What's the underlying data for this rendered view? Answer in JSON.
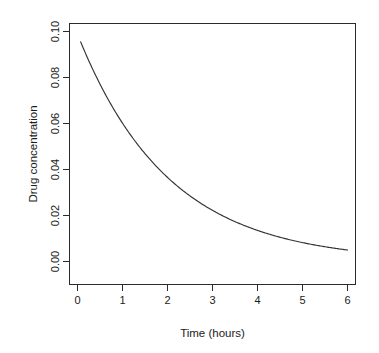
{
  "chart_data": {
    "type": "line",
    "title": "",
    "xlabel": "Time (hours)",
    "ylabel": "Drug concentration",
    "xlim": [
      -0.18,
      6.18
    ],
    "ylim": [
      -0.0045,
      0.1045
    ],
    "xticks": [
      0,
      1,
      2,
      3,
      4,
      5,
      6
    ],
    "xticklabels": [
      "0",
      "1",
      "2",
      "3",
      "4",
      "5",
      "6"
    ],
    "yticks": [
      0.0,
      0.02,
      0.04,
      0.06,
      0.08,
      0.1
    ],
    "yticklabels": [
      "0.00",
      "0.02",
      "0.04",
      "0.06",
      "0.08",
      "0.10"
    ],
    "grid": false,
    "legend": null,
    "box": true,
    "series": [
      {
        "name": "Drug concentration",
        "color": "#333333",
        "x": [
          0.07,
          0.25,
          0.5,
          0.75,
          1.0,
          1.25,
          1.5,
          1.75,
          2.0,
          2.25,
          2.5,
          2.75,
          3.0,
          3.25,
          3.5,
          3.75,
          4.0,
          4.25,
          4.5,
          4.75,
          5.0,
          5.25,
          5.5,
          5.75,
          6.0
        ],
        "y": [
          0.0955,
          0.0875,
          0.0785,
          0.0705,
          0.063,
          0.0565,
          0.0505,
          0.045,
          0.035,
          0.0315,
          0.0283,
          0.0254,
          0.02,
          0.018,
          0.0162,
          0.0146,
          0.011,
          0.0101,
          0.0092,
          0.0084,
          0.0077,
          0.007,
          0.0063,
          0.0056,
          0.005
        ]
      }
    ],
    "model": "C(t) = 0.1 * exp(-0.5 * t)"
  },
  "labels": {
    "x_axis_title": "Time (hours)",
    "y_axis_title": "Drug concentration"
  }
}
